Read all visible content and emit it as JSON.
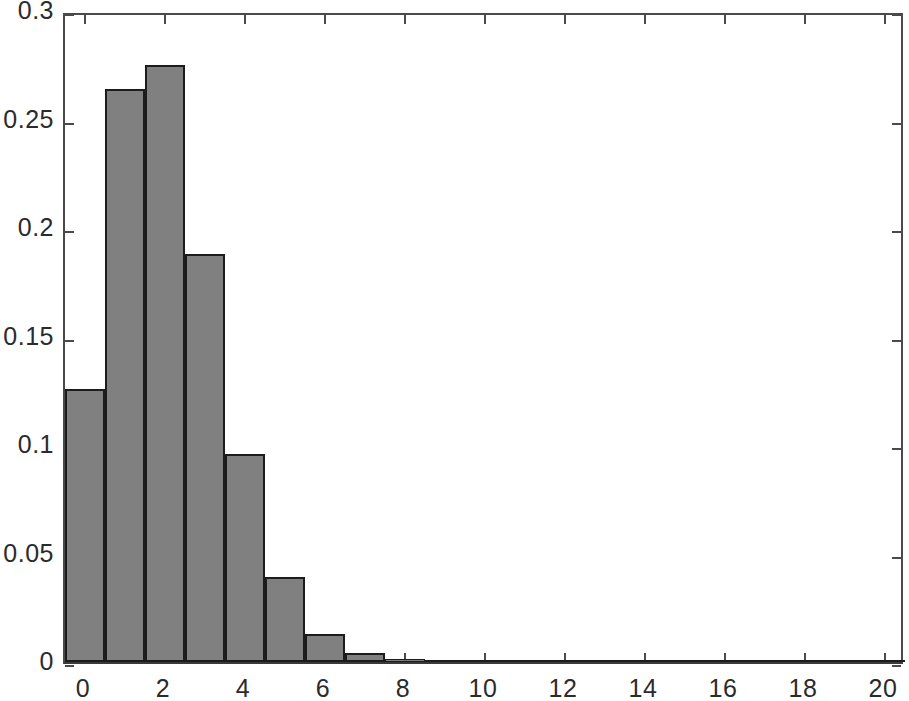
{
  "chart_data": {
    "type": "bar",
    "title": "",
    "subtitle": "",
    "xlabel": "",
    "ylabel": "",
    "xlim": [
      -0.5,
      20.5
    ],
    "ylim": [
      0,
      0.3
    ],
    "xticks": [
      0,
      2,
      4,
      6,
      8,
      10,
      12,
      14,
      16,
      18,
      20
    ],
    "xtick_labels": [
      "0",
      "2",
      "4",
      "6",
      "8",
      "10",
      "12",
      "14",
      "16",
      "18",
      "20"
    ],
    "yticks": [
      0,
      0.05,
      0.1,
      0.15,
      0.2,
      0.25,
      0.3
    ],
    "ytick_labels": [
      "0",
      "0.05",
      "0.1",
      "0.15",
      "0.2",
      "0.25",
      "0.3"
    ],
    "grid": false,
    "legend": null,
    "bar_width": 1,
    "bar_fill_color": "#808080",
    "bar_edge_color": "#1c1c1c",
    "axis_color": "#4a4a4a",
    "background_color": "#ffffff",
    "categories": [
      0,
      1,
      2,
      3,
      4,
      5,
      6,
      7,
      8,
      9,
      10,
      11,
      12,
      13,
      14,
      15,
      16,
      17,
      18,
      19,
      20
    ],
    "values": [
      0.126,
      0.264,
      0.275,
      0.188,
      0.096,
      0.039,
      0.013,
      0.004,
      0.0015,
      0.0008,
      0.0005,
      0.0004,
      0.0003,
      0.0003,
      0.0002,
      0.0002,
      0.0002,
      0.0002,
      0.0001,
      0.0001,
      0.0001
    ],
    "series": [
      {
        "name": "frequency",
        "values": [
          0.126,
          0.264,
          0.275,
          0.188,
          0.096,
          0.039,
          0.013,
          0.004,
          0.0015,
          0.0008,
          0.0005,
          0.0004,
          0.0003,
          0.0003,
          0.0002,
          0.0002,
          0.0002,
          0.0002,
          0.0001,
          0.0001,
          0.0001
        ]
      }
    ],
    "annotations": []
  }
}
